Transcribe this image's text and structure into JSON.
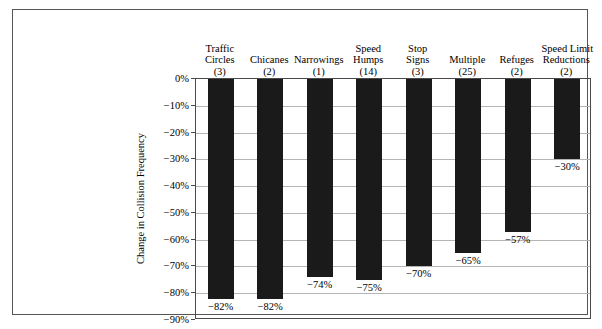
{
  "chart_data": {
    "type": "bar",
    "title": "",
    "subtitle": "",
    "xlabel": "",
    "ylabel": "Change in Collision Frequency",
    "ylim": [
      -90,
      0
    ],
    "grid": true,
    "legend": "none",
    "orientation": "vertical-negative",
    "categories": [
      "Traffic Circles",
      "Chicanes",
      "Narrowings",
      "Speed Humps",
      "Stop Signs",
      "Multiple",
      "Refuges",
      "Speed Limit Reductions"
    ],
    "category_lines": [
      [
        "Traffic",
        "Circles"
      ],
      [
        "Chicanes"
      ],
      [
        "Narrowings"
      ],
      [
        "Speed",
        "Humps"
      ],
      [
        "Stop",
        "Signs"
      ],
      [
        "Multiple"
      ],
      [
        "Refuges"
      ],
      [
        "Speed Limit",
        "Reductions"
      ]
    ],
    "counts": [
      3,
      2,
      1,
      14,
      3,
      25,
      2,
      2
    ],
    "count_labels": [
      "(3)",
      "(2)",
      "(1)",
      "(14)",
      "(3)",
      "(25)",
      "(2)",
      "(2)"
    ],
    "values": [
      -82,
      -82,
      -74,
      -75,
      -70,
      -65,
      -57,
      -30
    ],
    "value_labels": [
      "−82%",
      "−82%",
      "−74%",
      "−75%",
      "−70%",
      "−65%",
      "−57%",
      "−30%"
    ],
    "yticks": [
      0,
      -10,
      -20,
      -30,
      -40,
      -50,
      -60,
      -70,
      -80,
      -90
    ],
    "ytick_labels": [
      "0%",
      "−10%",
      "−20%",
      "−30%",
      "−40%",
      "−50%",
      "−60%",
      "−70%",
      "−80%",
      "−90%"
    ],
    "bar_color": "#1a1a1a",
    "grid_color": "#b4b4b4",
    "axis_color": "#4a4a4a",
    "frame_color": "#555555",
    "background_color": "#ffffff"
  }
}
